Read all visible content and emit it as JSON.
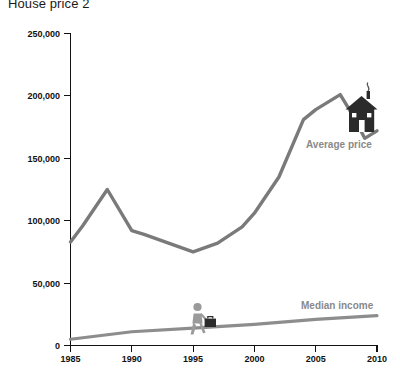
{
  "chart_data": {
    "type": "line",
    "title": "House price 2",
    "xlabel": "",
    "ylabel": "",
    "xlim": [
      1985,
      2010
    ],
    "ylim": [
      0,
      250000
    ],
    "grid": false,
    "legend_position": "inline-annotation",
    "x_ticks": [
      "1985",
      "1990",
      "1995",
      "2000",
      "2005",
      "2010"
    ],
    "x_tick_values": [
      1985,
      1990,
      1995,
      2000,
      2005,
      2010
    ],
    "y_ticks": [
      "0",
      "50,000",
      "100,000",
      "150,000",
      "200,000",
      "250,000"
    ],
    "y_tick_values": [
      0,
      50000,
      100000,
      150000,
      200000,
      250000
    ],
    "series": [
      {
        "name": "Average price",
        "color": "#7a7a7a",
        "x": [
          1985,
          1986,
          1988,
          1990,
          1991,
          1993,
          1995,
          1997,
          1999,
          2000,
          2002,
          2004,
          2005,
          2007,
          2008,
          2009,
          2010
        ],
        "values": [
          83000,
          96000,
          125000,
          92000,
          89000,
          82000,
          75000,
          82000,
          95000,
          106000,
          135000,
          181000,
          189000,
          201000,
          185000,
          166000,
          172000
        ]
      },
      {
        "name": "Median income",
        "color": "#8d8d8d",
        "x": [
          1985,
          1990,
          1995,
          2000,
          2005,
          2010
        ],
        "values": [
          5000,
          11000,
          14000,
          17000,
          21000,
          24000
        ]
      }
    ],
    "annotations": [
      {
        "text": "Average price",
        "x": 2005,
        "y": 158000,
        "color": "#8a8a8a"
      },
      {
        "text": "Median income",
        "x": 2005.5,
        "y": 36000,
        "color": "#8a8a8a"
      }
    ],
    "icons": [
      {
        "name": "house-icon",
        "x": 2008,
        "y": 182000
      },
      {
        "name": "businessman-briefcase-icon",
        "x": 1996.5,
        "y": 38000
      }
    ]
  }
}
